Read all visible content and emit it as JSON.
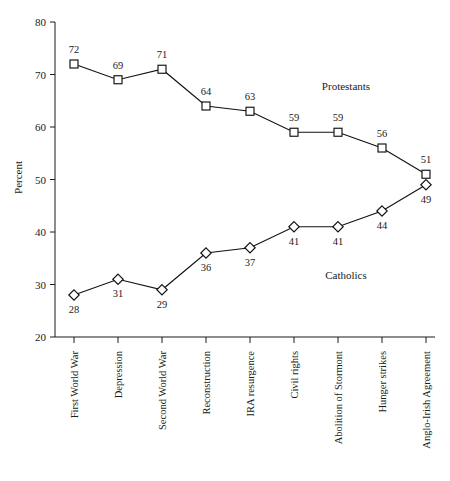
{
  "chart_data": {
    "type": "line",
    "title": "",
    "xlabel": "",
    "ylabel": "Percent",
    "ylim": [
      20,
      80
    ],
    "yticks": [
      20,
      30,
      40,
      50,
      60,
      70,
      80
    ],
    "grid": false,
    "legend_position": "inline-annotation",
    "categories": [
      "First World War",
      "Depression",
      "Second World War",
      "Reconstruction",
      "IRA resurgence",
      "Civil rights",
      "Abolition of Stormont",
      "Hunger strikes",
      "Anglo-Irish Agreement"
    ],
    "series": [
      {
        "name": "Protestants",
        "marker": "square",
        "values": [
          72,
          69,
          71,
          64,
          63,
          59,
          59,
          56,
          51
        ]
      },
      {
        "name": "Catholics",
        "marker": "diamond",
        "values": [
          28,
          31,
          29,
          36,
          37,
          41,
          41,
          44,
          49
        ]
      }
    ],
    "annotations": [
      {
        "text": "Protestants",
        "x_category_index": 6,
        "y_value": 67
      },
      {
        "text": "Catholics",
        "x_category_index": 6,
        "y_value": 31
      }
    ],
    "colors": {
      "line": "#111111",
      "marker_fill": "#ffffff",
      "axis": "#1a1a1a",
      "background": "#ffffff"
    }
  }
}
